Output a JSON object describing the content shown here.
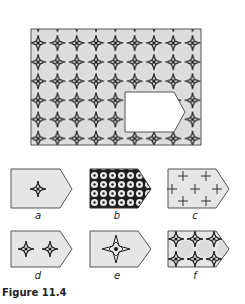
{
  "figure": {
    "caption": "Figure 11.4",
    "colors": {
      "panel_fill": "#e6e6e6",
      "circle_fill": "#dcdcdc",
      "outline": "#555555",
      "star": "#1a1a1a",
      "cutout": "#ffffff",
      "dark_fill": "#1e1e1e"
    },
    "main_panel": {
      "description": "Tiled pattern of four-pointed stars between circles with a missing piece cut out",
      "columns": 9,
      "rows": 6,
      "cutout_shape": "pentagon-arrow (rectangle with pointed right end)"
    },
    "options": [
      {
        "label": "a",
        "pattern": "single four-pointed star centered"
      },
      {
        "label": "b",
        "pattern": "dense dark grid of small white circles"
      },
      {
        "label": "c",
        "pattern": "scattered plus signs"
      },
      {
        "label": "d",
        "pattern": "two four-pointed stars"
      },
      {
        "label": "e",
        "pattern": "single large four-pointed star"
      },
      {
        "label": "f",
        "pattern": "two rows of stars between circles (matches main tiling)"
      }
    ]
  }
}
